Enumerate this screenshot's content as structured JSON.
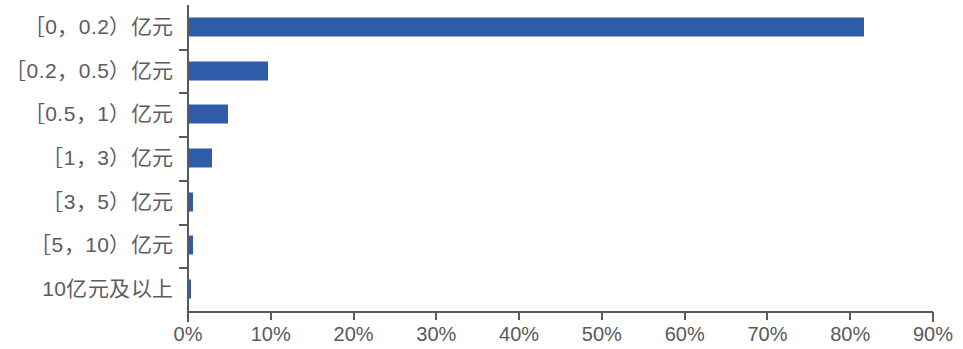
{
  "chart": {
    "accent_color": "#2e5ca9",
    "axis_color": "#5a5a5a",
    "text_color": "#59595b"
  },
  "chart_data": {
    "type": "bar",
    "orientation": "horizontal",
    "title": "",
    "subtitle": "",
    "xlabel": "",
    "ylabel": "",
    "xlim": [
      0,
      90
    ],
    "grid": false,
    "legend": false,
    "xtick_labels": [
      "0%",
      "10%",
      "20%",
      "30%",
      "40%",
      "50%",
      "60%",
      "70%",
      "80%",
      "90%"
    ],
    "xtick_values": [
      0,
      10,
      20,
      30,
      40,
      50,
      60,
      70,
      80,
      90
    ],
    "categories": [
      "［0，0.2）亿元",
      "［0.2，0.5）亿元",
      "［0.5，1）亿元",
      "［1，3）亿元",
      "［3，5）亿元",
      "［5，10）亿元",
      "10亿元及以上"
    ],
    "values": [
      81.5,
      9.6,
      4.7,
      2.8,
      0.5,
      0.5,
      0.2
    ],
    "value_unit": "%"
  }
}
